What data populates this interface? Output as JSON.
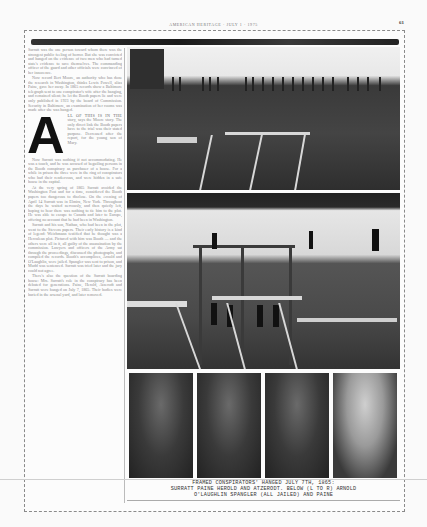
{
  "header": {
    "running_head": "AMERICAN HERITAGE · JULY 1 · 1975",
    "page_number": "61"
  },
  "article": {
    "paragraphs_before_dropcap": [
      "Surratt was the one person toward whom there was the strongest public feeling of horror. But she was convicted and hanged on the evidence of two men who had turned state's evidence to save themselves. The commanding officer of the guard and other officials were convinced of her innocence.",
      "Now record Bert Moore, an authority who has done the research in Washington, thinks Lewis Powell, alias Paine, gave her away. In 1865 records show a Baltimore telegraph sent to one conspirator's wife after the hanging, and remained silent; he let the Booth papers lie and were only published in 1923 by the board of Commission. Security in Baltimore, an examination of her rooms was made after she was hanged."
    ],
    "dropcap_letter": "A",
    "dropcap_lead": "LL OF THIS IS IN THE",
    "dropcap_paragraph": "story, says the Moore story. The only direct link the Booth papers have to the trial was their stated purpose. Decreased after the report, for the young son of Mary.",
    "paragraphs_after": [
      "Now Surratt was nothing if not accommodating. He was a touch, and he was accused of beguiling persons in the Booth conspiracy as purchaser of a house. For a while in prison the three were in the ring of conspirators who had their rendezvous, and were hidden in a safe house in the capital.",
      "At the very spring of 1865 Surratt avoided the Washington Post and for a time, considered the Booth papers too dangerous to disclose. On the evening of April 14 Surratt was in Elmira, New York. Throughout the days he waited nervously, and then quietly left, hoping to hear there was nothing to tie him to the plot. He was able to escape to Canada and later to Europe, offering no account that he had been in Washington.",
      "Surratt and his son, Nathan, who had been in the plot, went to the Stevens papers. Their early history is a kind of legend: Weichmann testified that he thought was a Herculean plot. Pictured with him was Booth — and the others were all in it, all guilty of the assassination by the commission. Lawyers and officers of the Army sat through the proceedings, discussed the photographs, and compiled the records. Booth's accomplices, Arnold and O'Laughlin, were jailed. Spangler was sent to prison, and Mudd was sentenced. Surratt was tried later and the jury could not agree.",
      "There's also the question of the Surratt boarding house: Mrs. Surratt's role in the conspiracy has been debated for generations. Paine, Herold, Atzerodt and Surratt were hanged on July 7, 1865. Their bodies were buried in the arsenal yard, and later removed."
    ]
  },
  "photos": [
    {
      "name": "gallows-crowd-photo",
      "description": "Crowd on prison wall above gallows"
    },
    {
      "name": "gallows-hanging-photo",
      "description": "Gallows with four conspirators hanging"
    }
  ],
  "portraits": [
    {
      "name": "arnold-portrait",
      "subject": "Arnold"
    },
    {
      "name": "oLaughlin-portrait",
      "subject": "O'Laughlin"
    },
    {
      "name": "spangler-portrait",
      "subject": "Spangler"
    },
    {
      "name": "paine-portrait",
      "subject": "Paine"
    }
  ],
  "caption": {
    "line1": "FRAMED CONSPIRATORS' HANGED JULY 7TH, 1865:",
    "line2": "SURRATT PAINE HEROLD AND ATZERODT. BELOW (L TO R) ARNOLD",
    "line3": "O'LAUGHLIN SPANGLER (ALL JAILED) AND PAINE"
  }
}
